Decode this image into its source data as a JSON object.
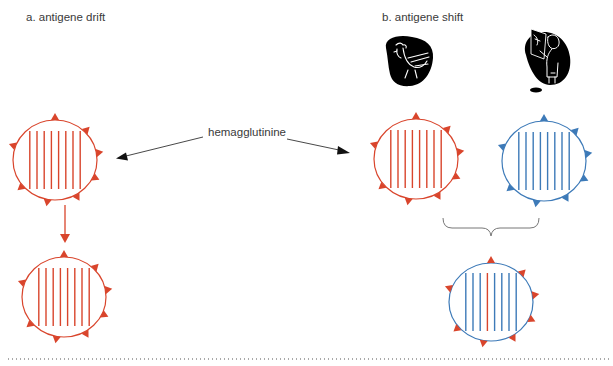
{
  "panels": {
    "drift": {
      "title": "a. antigene drift"
    },
    "shift": {
      "title": "b. antigene shift"
    }
  },
  "annotation": {
    "label": "hemagglutinine"
  },
  "icons": {
    "host_bird": "chicken-icon",
    "host_human": "human-scientist-icon"
  },
  "colors": {
    "red": "#d9452c",
    "blue": "#3d7ab8",
    "arrow": "#333333",
    "brace": "#777777",
    "text": "#3a3a3a"
  },
  "viruses": [
    {
      "id": "drift-original",
      "outline": "red",
      "spikes": "red",
      "stripes": [
        "red",
        "red",
        "red",
        "red",
        "red",
        "red",
        "red",
        "red"
      ]
    },
    {
      "id": "drift-mutated",
      "outline": "red",
      "spikes": "red",
      "stripes": [
        "red",
        "red",
        "red",
        "red",
        "red",
        "red",
        "red",
        "red"
      ]
    },
    {
      "id": "shift-avian",
      "outline": "red",
      "spikes": "red",
      "stripes": [
        "red",
        "red",
        "red",
        "red",
        "red",
        "red",
        "red",
        "red"
      ]
    },
    {
      "id": "shift-human",
      "outline": "blue",
      "spikes": "blue",
      "stripes": [
        "blue",
        "blue",
        "blue",
        "blue",
        "blue",
        "blue",
        "blue",
        "blue"
      ]
    },
    {
      "id": "shift-reassortant",
      "outline": "blue",
      "spikes": "red",
      "stripes": [
        "blue",
        "blue",
        "blue",
        "red",
        "blue",
        "blue",
        "blue",
        "blue"
      ]
    }
  ]
}
